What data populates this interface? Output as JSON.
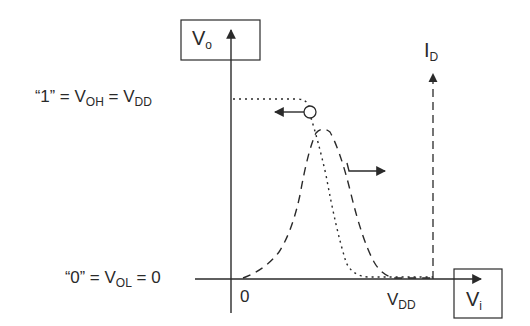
{
  "diagram": {
    "colors": {
      "ink": "#2a2a2a",
      "background": "#ffffff"
    },
    "y_axis": {
      "label_main": "V",
      "label_sub": "o"
    },
    "x_axis": {
      "label_main": "V",
      "label_sub": "i"
    },
    "current_axis": {
      "label_main": "I",
      "label_sub": "D"
    },
    "levels": {
      "high": {
        "quote_open": "“",
        "logic_value": "1",
        "quote_close": "”",
        "eq1": " = ",
        "v_main": "V",
        "v_sub": "OH",
        "eq2": " = ",
        "vdd_main": "V",
        "vdd_sub": "DD"
      },
      "low": {
        "quote_open": "“",
        "logic_value": "0",
        "quote_close": "”",
        "eq1": " = ",
        "v_main": "V",
        "v_sub": "OL",
        "eq2": " = ",
        "value": "0"
      }
    },
    "ticks": {
      "origin": "0",
      "vdd_main": "V",
      "vdd_sub": "DD"
    },
    "curves": [
      {
        "name": "voltage-transfer-curve",
        "style": "dotted",
        "description": "Vo vs Vi: high at VDD, falls to 0 near switching point"
      },
      {
        "name": "drain-current-curve",
        "style": "dashed",
        "description": "ID vs Vi: bell-shaped, peaks at switching point"
      }
    ],
    "annotations": [
      {
        "name": "switching-point-marker",
        "shape": "circle"
      },
      {
        "name": "vtc-pointer-arrow",
        "direction": "left"
      },
      {
        "name": "current-pointer-arrow",
        "direction": "right"
      }
    ]
  }
}
